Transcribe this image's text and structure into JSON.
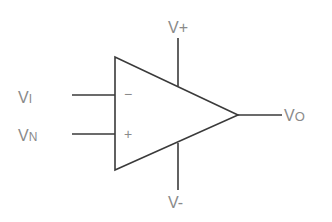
{
  "diagram": {
    "type": "op-amp symbol",
    "line_color": "#3a3a3a",
    "label_color": "#8a8a8a",
    "labels": {
      "inverting_input": "V",
      "inverting_input_sub": "I",
      "noninverting_input": "V",
      "noninverting_input_sub": "N",
      "positive_supply": "V+",
      "negative_supply": "V-",
      "output": "V",
      "output_sub": "O"
    },
    "pin_signs": {
      "inverting": "−",
      "noninverting": "+"
    }
  }
}
